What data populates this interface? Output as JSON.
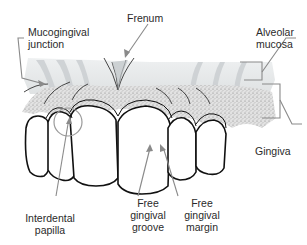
{
  "figure": {
    "colors": {
      "leader": "#8a8a8a",
      "outline": "#111111",
      "mucosa": "#e4e6e7",
      "gingiva": "#cfcfcf",
      "background": "#ffffff"
    }
  },
  "labels": {
    "mucogingival": [
      "Mucogingival",
      "junction"
    ],
    "frenum": [
      "Frenum"
    ],
    "alveolar_mucosa": [
      "Alveolar",
      "mucosa"
    ],
    "gingiva": [
      "Gingiva"
    ],
    "interdental_papilla": [
      "Interdental",
      "papilla"
    ],
    "free_gingival_groove": [
      "Free",
      "gingival",
      "groove"
    ],
    "free_gingival_margin": [
      "Free",
      "gingival",
      "margin"
    ]
  }
}
